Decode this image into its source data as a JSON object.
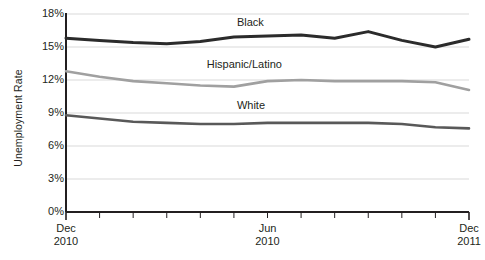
{
  "chart_data": {
    "type": "line",
    "title": "",
    "xlabel": "",
    "ylabel": "Unemployment Rate",
    "ylim": [
      0,
      18
    ],
    "ytick_labels": [
      "18%",
      "15%",
      "12%",
      "9%",
      "6%",
      "3%",
      "0%"
    ],
    "ytick_values": [
      18,
      15,
      12,
      9,
      6,
      3,
      0
    ],
    "grid": true,
    "legend_position": "inline-right-of-series",
    "x_axis_tick_count": 13,
    "x_tick_labels": [
      {
        "line1": "Dec",
        "line2": "2010",
        "index": 0
      },
      {
        "line1": "Jun",
        "line2": "2010",
        "index": 6
      },
      {
        "line1": "Dec",
        "line2": "2011",
        "index": 12
      }
    ],
    "x": [
      0,
      1,
      2,
      3,
      4,
      5,
      6,
      7,
      8,
      9,
      10,
      11,
      12
    ],
    "series": [
      {
        "name": "Black",
        "color": "#2b2b2b",
        "values": [
          15.8,
          15.6,
          15.4,
          15.3,
          15.5,
          15.9,
          16.0,
          16.1,
          15.8,
          16.4,
          15.6,
          15.0,
          15.7
        ]
      },
      {
        "name": "Hispanic/Latino",
        "color": "#a0a0a0",
        "values": [
          12.8,
          12.3,
          11.9,
          11.7,
          11.5,
          11.4,
          11.9,
          12.0,
          11.9,
          11.9,
          11.9,
          11.8,
          11.1
        ]
      },
      {
        "name": "White",
        "color": "#595959",
        "values": [
          8.8,
          8.5,
          8.2,
          8.1,
          8.0,
          8.0,
          8.1,
          8.1,
          8.1,
          8.1,
          8.0,
          7.7,
          7.6
        ]
      }
    ],
    "series_label_positions": [
      {
        "name": "Black",
        "x_index": 5.0,
        "y_value": 17.2
      },
      {
        "name": "Hispanic/Latino",
        "x_index": 4.1,
        "y_value": 13.4
      },
      {
        "name": "White",
        "x_index": 5.0,
        "y_value": 9.6
      }
    ],
    "source_note": ""
  },
  "axis": {
    "y_title": "Unemployment Rate"
  }
}
